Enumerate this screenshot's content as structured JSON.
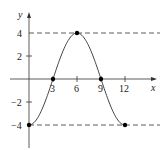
{
  "chart_data": {
    "type": "line",
    "title": "",
    "xlabel": "x",
    "ylabel": "y",
    "function": "y = -4 cos(pi x / 6)",
    "x": [
      0,
      3,
      6,
      9,
      12
    ],
    "values": [
      -4,
      0,
      4,
      0,
      -4
    ],
    "marked_points": [
      [
        0,
        -4
      ],
      [
        3,
        0
      ],
      [
        6,
        4
      ],
      [
        9,
        0
      ],
      [
        12,
        -4
      ]
    ],
    "x_ticks": [
      "3",
      "6",
      "9",
      "12"
    ],
    "y_ticks": [
      "4",
      "2",
      "-2",
      "-4"
    ],
    "xlim": [
      0,
      15
    ],
    "ylim": [
      -5.5,
      5.5
    ],
    "reference_lines": [
      {
        "y": 4,
        "style": "dashed"
      },
      {
        "y": -4,
        "style": "dashed"
      }
    ],
    "grid": false,
    "legend": null
  },
  "labels": {
    "x_axis": "x",
    "y_axis": "y",
    "xt3": "3",
    "xt6": "6",
    "xt9": "9",
    "xt12": "12",
    "yt4": "4",
    "yt2": "2",
    "ytm2": "−2",
    "ytm4": "−4"
  }
}
